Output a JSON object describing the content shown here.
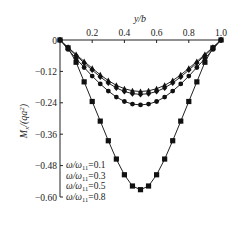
{
  "chart_data": {
    "type": "line",
    "title": "",
    "xlabel": "y/b",
    "ylabel": "Mx/(qa²)",
    "xlim": [
      0,
      1.0
    ],
    "ylim": [
      -0.6,
      0
    ],
    "x_axis_position": "top",
    "grid": false,
    "xticks": [
      0.2,
      0.4,
      0.6,
      0.8,
      1.0
    ],
    "xtick_labels": [
      "0.2",
      "0.4",
      "0.6",
      "0.8",
      "1.0"
    ],
    "yticks": [
      0,
      -0.12,
      -0.24,
      -0.36,
      -0.48,
      -0.6
    ],
    "ytick_labels": [
      "0",
      "−0.12",
      "−0.24",
      "−0.36",
      "−0.48",
      "−0.60"
    ],
    "legend_position": "lower left",
    "x": [
      0,
      0.05,
      0.1,
      0.15,
      0.2,
      0.25,
      0.3,
      0.35,
      0.4,
      0.45,
      0.5,
      0.55,
      0.6,
      0.65,
      0.7,
      0.75,
      0.8,
      0.85,
      0.9,
      0.95,
      1.0
    ],
    "series": [
      {
        "name": "ω/ω11=0.1",
        "marker": "triangle",
        "values": [
          0,
          -0.028,
          -0.055,
          -0.082,
          -0.108,
          -0.133,
          -0.155,
          -0.173,
          -0.186,
          -0.194,
          -0.197,
          -0.194,
          -0.186,
          -0.173,
          -0.155,
          -0.133,
          -0.108,
          -0.082,
          -0.055,
          -0.028,
          0
        ]
      },
      {
        "name": "ω/ω11=0.3",
        "marker": "diamond",
        "values": [
          0,
          -0.03,
          -0.059,
          -0.088,
          -0.115,
          -0.141,
          -0.164,
          -0.183,
          -0.197,
          -0.205,
          -0.208,
          -0.205,
          -0.197,
          -0.183,
          -0.164,
          -0.141,
          -0.115,
          -0.088,
          -0.059,
          -0.03,
          0
        ]
      },
      {
        "name": "ω/ω11=0.5",
        "marker": "circle",
        "values": [
          0,
          -0.036,
          -0.071,
          -0.105,
          -0.138,
          -0.168,
          -0.195,
          -0.218,
          -0.235,
          -0.245,
          -0.248,
          -0.245,
          -0.235,
          -0.218,
          -0.195,
          -0.168,
          -0.138,
          -0.105,
          -0.071,
          -0.036,
          0
        ]
      },
      {
        "name": "ω/ω11=0.8",
        "marker": "square",
        "values": [
          0,
          -0.03,
          -0.085,
          -0.16,
          -0.235,
          -0.31,
          -0.385,
          -0.455,
          -0.515,
          -0.558,
          -0.572,
          -0.558,
          -0.515,
          -0.455,
          -0.385,
          -0.31,
          -0.235,
          -0.16,
          -0.085,
          -0.03,
          0
        ]
      }
    ]
  },
  "legend": {
    "items": [
      {
        "prefix": "ω/ω",
        "sub": "11",
        "suffix": "=0.1"
      },
      {
        "prefix": "ω/ω",
        "sub": "11",
        "suffix": "=0.3"
      },
      {
        "prefix": "ω/ω",
        "sub": "11",
        "suffix": "=0.5"
      },
      {
        "prefix": "ω/ω",
        "sub": "11",
        "suffix": "=0.8"
      }
    ]
  },
  "labels": {
    "xlabel": "y/b",
    "ylabel_main": "M",
    "ylabel_sub": "x",
    "ylabel_rest": "/(qa",
    "ylabel_sup": "2",
    "ylabel_end": ")"
  }
}
